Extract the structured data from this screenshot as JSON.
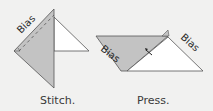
{
  "colors": {
    "background": "#f1f1f0",
    "fabric_gray": "#c3c3c3",
    "fabric_white": "#ffffff",
    "stroke": "#555555"
  },
  "panels": [
    {
      "id": "stitch",
      "caption": "Stitch.",
      "bias_labels": [
        "Bias"
      ]
    },
    {
      "id": "press",
      "caption": "Press.",
      "bias_labels": [
        "Bias",
        "Bias"
      ]
    }
  ]
}
